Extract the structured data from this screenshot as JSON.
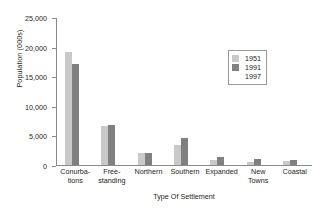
{
  "chart_data": {
    "type": "bar",
    "title": "",
    "xlabel": "Type Of Settlement",
    "ylabel": "Population (000s)",
    "ylim": [
      0,
      25000
    ],
    "yticks": [
      0,
      5000,
      10000,
      15000,
      20000,
      25000
    ],
    "ytick_labels": [
      "0",
      "5,000",
      "10,000",
      "15,000",
      "20,000",
      "25,000"
    ],
    "grid": false,
    "legend_position": "upper right",
    "categories": [
      "Conurbations",
      "Free-standing",
      "Northern",
      "Southern",
      "Expanded",
      "New Towns",
      "Coastal"
    ],
    "category_label_lines": [
      [
        "Conurba-",
        "tions"
      ],
      [
        "Free-",
        "standing"
      ],
      [
        "Northern",
        ""
      ],
      [
        "Southern",
        ""
      ],
      [
        "Expanded",
        ""
      ],
      [
        "New",
        "Towns"
      ],
      [
        "Coastal",
        ""
      ]
    ],
    "series": [
      {
        "name": "1951",
        "color": "#c9c9c9",
        "values": [
          19100,
          6600,
          2100,
          3300,
          900,
          500,
          700
        ]
      },
      {
        "name": "1991",
        "color": "#808080",
        "values": [
          17000,
          6700,
          2100,
          4500,
          1300,
          1100,
          900
        ]
      },
      {
        "name": "1997",
        "color": "#ffffff",
        "values": [
          0,
          0,
          0,
          0,
          0,
          0,
          0
        ]
      }
    ]
  },
  "legend": {
    "items": [
      {
        "label": "1951",
        "color": "#c9c9c9"
      },
      {
        "label": "1991",
        "color": "#808080"
      },
      {
        "label": "1997",
        "color": "#ffffff"
      }
    ]
  }
}
